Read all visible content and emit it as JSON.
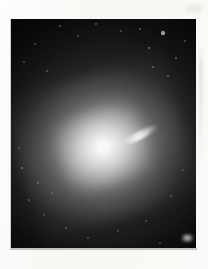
{
  "image": {
    "kind": "astronomical-plate-photograph",
    "subject": "elliptical galaxy with relativistic jet",
    "color_mode": "grayscale",
    "background_color": "#f8f8f6",
    "plate_color": "#050505",
    "caption": ""
  },
  "plate": {
    "left": 11,
    "top": 19,
    "width": 185,
    "height": 229
  },
  "galaxy": {
    "nucleus_x": 110,
    "nucleus_y": 147,
    "halo_shape": "elliptical",
    "halo_position_angle_deg": -18,
    "peak_brightness": "#ffffff",
    "halo_mid_tone": "#8c8c8c"
  },
  "jet": {
    "origin_x": 112,
    "origin_y": 147,
    "tip_x": 147,
    "tip_y": 129,
    "angle_deg": -27,
    "length_px": 40,
    "brightness": "#ffffff"
  },
  "artifact": {
    "name": "bright-corner-spot",
    "x": 182,
    "y": 234,
    "width": 11,
    "height": 8
  },
  "stars": [
    {
      "x": 163,
      "y": 33,
      "r": 1.6,
      "a": 0.85
    },
    {
      "x": 149,
      "y": 48,
      "r": 1.0,
      "a": 0.55
    },
    {
      "x": 176,
      "y": 58,
      "r": 0.9,
      "a": 0.45
    },
    {
      "x": 153,
      "y": 67,
      "r": 0.8,
      "a": 0.4
    },
    {
      "x": 168,
      "y": 76,
      "r": 0.7,
      "a": 0.35
    },
    {
      "x": 140,
      "y": 29,
      "r": 0.8,
      "a": 0.38
    },
    {
      "x": 185,
      "y": 41,
      "r": 0.7,
      "a": 0.32
    },
    {
      "x": 60,
      "y": 26,
      "r": 1.0,
      "a": 0.45
    },
    {
      "x": 35,
      "y": 44,
      "r": 0.8,
      "a": 0.33
    },
    {
      "x": 24,
      "y": 62,
      "r": 0.7,
      "a": 0.3
    },
    {
      "x": 47,
      "y": 71,
      "r": 0.7,
      "a": 0.28
    },
    {
      "x": 78,
      "y": 36,
      "r": 0.8,
      "a": 0.34
    },
    {
      "x": 96,
      "y": 24,
      "r": 0.9,
      "a": 0.4
    },
    {
      "x": 121,
      "y": 31,
      "r": 0.7,
      "a": 0.3
    },
    {
      "x": 22,
      "y": 168,
      "r": 1.1,
      "a": 0.5
    },
    {
      "x": 38,
      "y": 183,
      "r": 0.8,
      "a": 0.34
    },
    {
      "x": 29,
      "y": 200,
      "r": 0.7,
      "a": 0.3
    },
    {
      "x": 52,
      "y": 193,
      "r": 0.7,
      "a": 0.28
    },
    {
      "x": 19,
      "y": 148,
      "r": 0.8,
      "a": 0.32
    },
    {
      "x": 44,
      "y": 215,
      "r": 0.7,
      "a": 0.28
    },
    {
      "x": 66,
      "y": 228,
      "r": 0.8,
      "a": 0.3
    },
    {
      "x": 88,
      "y": 238,
      "r": 0.7,
      "a": 0.26
    },
    {
      "x": 118,
      "y": 231,
      "r": 0.8,
      "a": 0.3
    },
    {
      "x": 146,
      "y": 221,
      "r": 0.7,
      "a": 0.28
    },
    {
      "x": 171,
      "y": 196,
      "r": 0.8,
      "a": 0.32
    },
    {
      "x": 183,
      "y": 170,
      "r": 0.7,
      "a": 0.28
    },
    {
      "x": 160,
      "y": 243,
      "r": 0.7,
      "a": 0.24
    },
    {
      "x": 104,
      "y": 208,
      "r": 0.6,
      "a": 0.22
    }
  ]
}
